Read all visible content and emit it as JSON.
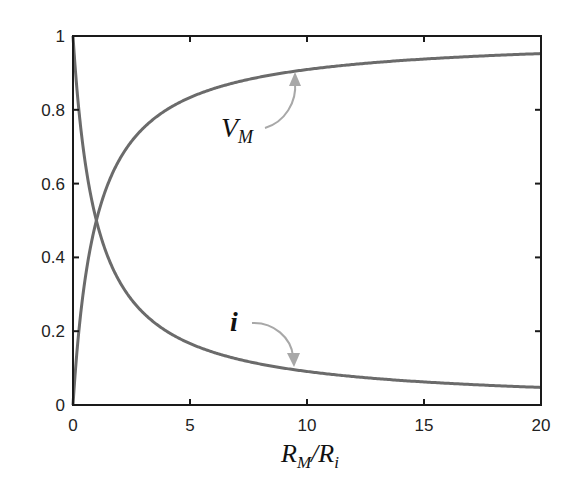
{
  "chart_data": {
    "type": "line",
    "title": "",
    "xlabel": "R_M/R_i",
    "xlabel_main": "R",
    "xlabel_sub1": "M",
    "xlabel_slash": "/R",
    "xlabel_sub2": "i",
    "ylabel": "",
    "xlim": [
      0,
      20
    ],
    "ylim": [
      0,
      1
    ],
    "xticks": [
      0,
      5,
      10,
      15,
      20
    ],
    "xtick_labels": [
      "0",
      "5",
      "10",
      "15",
      "20"
    ],
    "yticks": [
      0,
      0.2,
      0.4,
      0.6,
      0.8,
      1
    ],
    "ytick_labels": [
      "0",
      "0.2",
      "0.4",
      "0.6",
      "0.8",
      "1"
    ],
    "grid": false,
    "legend": "none",
    "series": [
      {
        "name": "V_M",
        "label_main": "V",
        "label_sub": "M",
        "formula": "x/(1+x)",
        "x": [
          0,
          0.25,
          0.5,
          1,
          2,
          3,
          5,
          10,
          15,
          20
        ],
        "values": [
          0,
          0.2,
          0.333,
          0.5,
          0.667,
          0.75,
          0.833,
          0.909,
          0.9375,
          0.952
        ],
        "color": "#6b6b6b"
      },
      {
        "name": "i",
        "label_main": "i",
        "formula": "1/(1+x)",
        "x": [
          0,
          0.25,
          0.5,
          1,
          2,
          3,
          5,
          10,
          15,
          20
        ],
        "values": [
          1,
          0.8,
          0.667,
          0.5,
          0.333,
          0.25,
          0.167,
          0.091,
          0.0625,
          0.048
        ],
        "color": "#6b6b6b"
      }
    ],
    "annotations": [
      {
        "text": "V_M",
        "target_series": "V_M",
        "arrow_color": "#a8a8a8"
      },
      {
        "text": "i",
        "target_series": "i",
        "arrow_color": "#a8a8a8"
      }
    ],
    "colors": {
      "axis": "#1a1a1a",
      "curve": "#6b6b6b",
      "arrow": "#a8a8a8"
    }
  }
}
